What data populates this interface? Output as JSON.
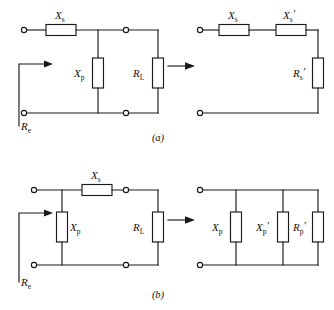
{
  "figure": {
    "background_color": "#ffffff",
    "line_color": "#1a1a1a",
    "width": 334,
    "height": 310
  },
  "panels": [
    {
      "caption": "(a)",
      "left_circuit": {
        "description": "series-X_s with shunt X_p driving load R_L",
        "input_label": "R",
        "input_sub": "e",
        "components": [
          {
            "label": "X",
            "sub": "s",
            "prime": "",
            "orientation": "horizontal"
          },
          {
            "label": "X",
            "sub": "p",
            "prime": "",
            "orientation": "vertical"
          },
          {
            "label": "R",
            "sub": "L",
            "prime": "",
            "orientation": "vertical"
          }
        ]
      },
      "right_circuit": {
        "description": "series X_s, X_s-prime and R_s-prime",
        "components": [
          {
            "label": "X",
            "sub": "s",
            "prime": "",
            "orientation": "horizontal"
          },
          {
            "label": "X",
            "sub": "s",
            "prime": "′",
            "orientation": "horizontal"
          },
          {
            "label": "R",
            "sub": "s",
            "prime": "′",
            "orientation": "vertical"
          }
        ]
      }
    },
    {
      "caption": "(b)",
      "left_circuit": {
        "description": "shunt X_p then series X_s driving load R_L",
        "input_label": "R",
        "input_sub": "e",
        "components": [
          {
            "label": "X",
            "sub": "s",
            "prime": "",
            "orientation": "horizontal"
          },
          {
            "label": "X",
            "sub": "p",
            "prime": "",
            "orientation": "vertical"
          },
          {
            "label": "R",
            "sub": "L",
            "prime": "",
            "orientation": "vertical"
          }
        ]
      },
      "right_circuit": {
        "description": "three parallel shunt branches",
        "components": [
          {
            "label": "X",
            "sub": "p",
            "prime": "",
            "orientation": "vertical"
          },
          {
            "label": "X",
            "sub": "p",
            "prime": "′",
            "orientation": "vertical"
          },
          {
            "label": "R",
            "sub": "p",
            "prime": "′",
            "orientation": "vertical"
          }
        ]
      }
    }
  ],
  "labels": {
    "a_xs": "X",
    "a_xs_sub": "s",
    "a_xp": "X",
    "a_xp_sub": "p",
    "a_rl": "R",
    "a_rl_sub": "L",
    "a_re": "R",
    "a_re_sub": "e",
    "a_r_xs": "X",
    "a_r_xs_sub": "s",
    "a_r_xsp": "X",
    "a_r_xsp_sub": "s",
    "a_r_xsp_prime": "′",
    "a_r_rsp": "R",
    "a_r_rsp_sub": "s",
    "a_r_rsp_prime": "′",
    "b_xs": "X",
    "b_xs_sub": "s",
    "b_xp": "X",
    "b_xp_sub": "p",
    "b_rl": "R",
    "b_rl_sub": "L",
    "b_re": "R",
    "b_re_sub": "e",
    "b_r_xp": "X",
    "b_r_xp_sub": "p",
    "b_r_xpp": "X",
    "b_r_xpp_sub": "p",
    "b_r_xpp_prime": "′",
    "b_r_rpp": "R",
    "b_r_rpp_sub": "p",
    "b_r_rpp_prime": "′",
    "caption_a": "(a)",
    "caption_b": "(b)"
  }
}
